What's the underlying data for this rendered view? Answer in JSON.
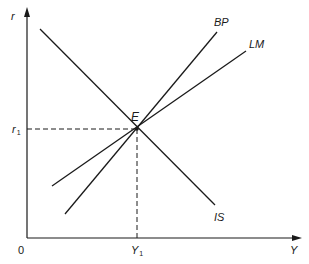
{
  "diagram": {
    "type": "IS-LM-BP equilibrium diagram",
    "axes": {
      "y_axis_label": "r",
      "x_axis_label": "Y",
      "origin_label": "0"
    },
    "curves": [
      {
        "id": "IS",
        "label": "IS",
        "slope": "negative"
      },
      {
        "id": "LM",
        "label": "LM",
        "slope": "positive"
      },
      {
        "id": "BP",
        "label": "BP",
        "slope": "positive, steeper than LM"
      }
    ],
    "equilibrium": {
      "label": "E",
      "r_label": "r",
      "r_subscript": "1",
      "y_label": "Y",
      "y_subscript": "1"
    },
    "colors": {
      "line": "#1a1a1a",
      "background": "#ffffff"
    }
  }
}
